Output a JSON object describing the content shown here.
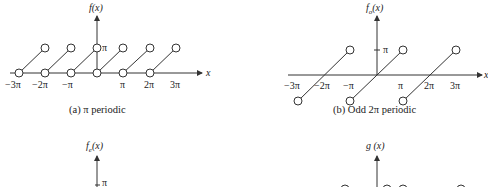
{
  "panels": [
    {
      "id": "a",
      "ylabel": "f(x)",
      "caption": "(a) π periodic",
      "xaxis_label": "x",
      "ytick": "π",
      "xticks": [
        "−3π",
        "−2π",
        "−π",
        "π",
        "2π",
        "3π"
      ]
    },
    {
      "id": "b",
      "ylabel": "f",
      "ylabel_sub": "o",
      "ylabel_arg": "(x)",
      "caption": "(b) Odd 2π periodic",
      "xaxis_label": "x",
      "ytick": "π",
      "xticks": [
        "−3π",
        "−2π",
        "−π",
        "π",
        "2π",
        "3π"
      ]
    },
    {
      "id": "c",
      "ylabel": "f",
      "ylabel_sub": "e",
      "ylabel_arg": "(x)",
      "ytick": "π"
    },
    {
      "id": "d",
      "ylabel": "g (x)"
    }
  ],
  "colors": {
    "line": "#333333",
    "text": "#222222",
    "background": "#ffffff"
  }
}
